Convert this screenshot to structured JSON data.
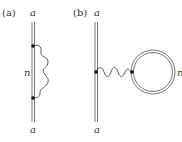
{
  "panels": [
    {
      "id": "a",
      "panel_label": "(a)",
      "top_label": "a",
      "bottom_label": "a",
      "loop_label": "n",
      "description": "Self-energy diagram: double-line propagator with wavy line emitted and reabsorbed"
    },
    {
      "id": "b",
      "panel_label": "(b)",
      "top_label": "a",
      "bottom_label": "a",
      "loop_label": "n",
      "description": "Tadpole diagram: double-line propagator with wavy line connected to closed double-line loop"
    }
  ],
  "colors": {
    "line": "#555555",
    "dot": "#111111",
    "text": "#333333"
  }
}
